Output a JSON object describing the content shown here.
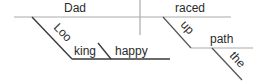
{
  "diagram": {
    "type": "sentence-diagram",
    "words": {
      "subject": "Dad",
      "verb": "raced",
      "participle": "Looking",
      "participle_complement": "happy",
      "adverb": "up",
      "object_of_preposition": "path",
      "article": "the"
    },
    "colors": {
      "text": "#2a2a2a",
      "line": "#555555",
      "baseline": "#aaaaaa"
    }
  }
}
